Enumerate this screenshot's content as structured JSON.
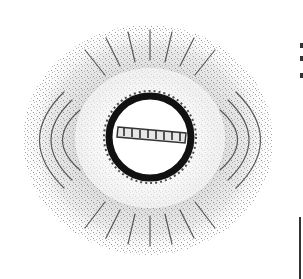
{
  "image": {
    "subject": "Iron filings showing magnetic field lines around a ring with a bar magnet across its center",
    "alt": "Iron filings magnetic field pattern",
    "colors": {
      "background": "#ffffff",
      "filings": "#1a1a1a",
      "ring": "#0d0d0d"
    }
  }
}
